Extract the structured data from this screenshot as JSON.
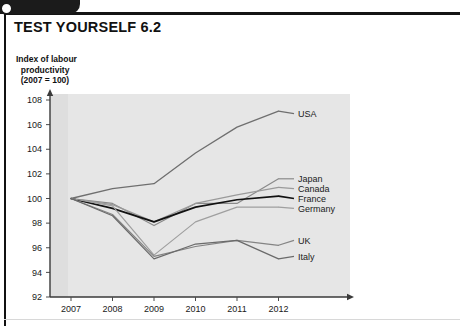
{
  "page": {
    "title": "TEST YOURSELF 6.2",
    "bottom_caption": ""
  },
  "chart_data": {
    "type": "line",
    "title": "",
    "ylabel": "Index of labour\n  productivity\n  (2007 = 100)",
    "xlabel": "",
    "categories": [
      "2007",
      "2008",
      "2009",
      "2010",
      "2011",
      "2012"
    ],
    "x": [
      2007,
      2008,
      2009,
      2010,
      2011,
      2012
    ],
    "ylim": [
      92,
      108
    ],
    "yticks": [
      92,
      94,
      96,
      98,
      100,
      102,
      104,
      106,
      108
    ],
    "xticks": [
      "2007",
      "2008",
      "2009",
      "2010",
      "2011",
      "2012"
    ],
    "grid": false,
    "legend": "right-inline",
    "series": [
      {
        "name": "USA",
        "values": [
          100.0,
          100.8,
          101.2,
          103.7,
          105.8,
          107.1
        ],
        "color": "#6f6f6f",
        "width": 1.3,
        "label_y": 106.9
      },
      {
        "name": "Japan",
        "values": [
          100.0,
          99.6,
          97.8,
          99.6,
          99.6,
          101.6
        ],
        "color": "#8a8a8a",
        "width": 1.2,
        "label_y": 101.6
      },
      {
        "name": "Canada",
        "values": [
          100.0,
          99.5,
          98.1,
          99.6,
          100.3,
          100.9
        ],
        "color": "#9a9a9a",
        "width": 1.2,
        "label_y": 100.8
      },
      {
        "name": "France",
        "values": [
          100.0,
          99.2,
          98.1,
          99.3,
          99.9,
          100.2
        ],
        "color": "#111111",
        "width": 1.7,
        "label_y": 100.0
      },
      {
        "name": "Germany",
        "values": [
          100.0,
          99.4,
          95.4,
          98.1,
          99.3,
          99.3
        ],
        "color": "#9f9f9f",
        "width": 1.2,
        "label_y": 99.2
      },
      {
        "name": "UK",
        "values": [
          100.0,
          98.7,
          95.3,
          96.1,
          96.6,
          96.2
        ],
        "color": "#848484",
        "width": 1.2,
        "label_y": 96.6
      },
      {
        "name": "Italy",
        "values": [
          100.0,
          98.6,
          95.1,
          96.3,
          96.6,
          95.1
        ],
        "color": "#6a6a6a",
        "width": 1.2,
        "label_y": 95.3
      }
    ]
  }
}
